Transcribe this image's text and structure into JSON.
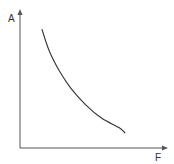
{
  "chart_data": {
    "type": "line",
    "title": "",
    "xlabel": "F",
    "ylabel": "A",
    "grid": false,
    "legend": null,
    "ticks": {
      "x": [],
      "y": []
    },
    "series": [
      {
        "name": "A vs F",
        "points_normalized": [
          [
            0.15,
            0.88
          ],
          [
            0.2,
            0.72
          ],
          [
            0.27,
            0.57
          ],
          [
            0.35,
            0.44
          ],
          [
            0.45,
            0.32
          ],
          [
            0.56,
            0.22
          ],
          [
            0.68,
            0.15
          ],
          [
            0.72,
            0.11
          ]
        ]
      }
    ],
    "xlim": [
      0,
      1
    ],
    "ylim": [
      0,
      1
    ]
  },
  "colors": {
    "axis": "#555555",
    "curve": "#333333",
    "background": "#ffffff"
  }
}
